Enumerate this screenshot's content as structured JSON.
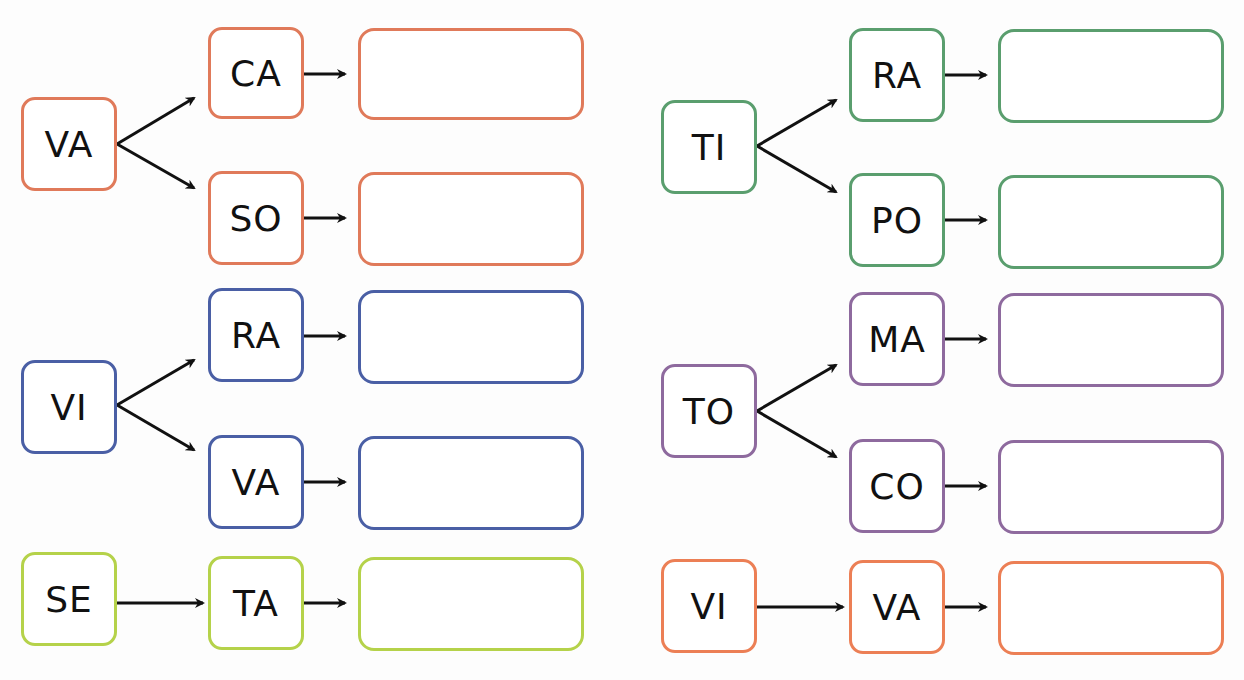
{
  "colors": {
    "orange": "#e07a5a",
    "blue": "#4a5fa5",
    "lightgreen": "#b5d24a",
    "green": "#5a9e6e",
    "purple": "#8e6a9e",
    "orange2": "#ec7f55",
    "arrow": "#111111"
  },
  "groups": [
    {
      "id": "g1",
      "color": "orange",
      "root": "VA",
      "branches": [
        "CA",
        "SO"
      ]
    },
    {
      "id": "g2",
      "color": "blue",
      "root": "VI",
      "branches": [
        "RA",
        "VA"
      ]
    },
    {
      "id": "g3",
      "color": "lightgreen",
      "root": "SE",
      "branches": [
        "TA"
      ]
    },
    {
      "id": "g4",
      "color": "green",
      "root": "TI",
      "branches": [
        "RA",
        "PO"
      ]
    },
    {
      "id": "g5",
      "color": "purple",
      "root": "TO",
      "branches": [
        "MA",
        "CO"
      ]
    },
    {
      "id": "g6",
      "color": "orange2",
      "root": "VI",
      "branches": [
        "VA"
      ]
    }
  ],
  "answers": [
    "",
    "",
    "",
    "",
    "",
    "",
    "",
    "",
    "",
    ""
  ]
}
